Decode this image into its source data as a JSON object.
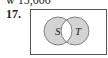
{
  "header": {
    "cut_text": "w 15,000"
  },
  "problem": {
    "number": "17."
  },
  "venn": {
    "sets": [
      {
        "label": "S"
      },
      {
        "label": "T"
      }
    ],
    "shaded_region": "symmetric difference (S ∪ T minus S ∩ T)",
    "shade_color": "#d4d4d4",
    "outline_color": "#555555"
  }
}
